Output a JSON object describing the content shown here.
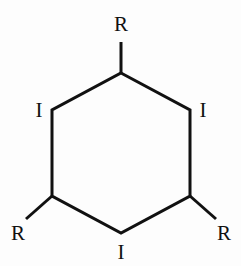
{
  "diagram": {
    "kind": "chemical-structure",
    "name": "substituted-cyclohexane-skeletal-formula",
    "background_color": "#fdfdfd",
    "bond_color": "#111111",
    "label_color": "#111111",
    "bond_width_px": 3,
    "ring": {
      "name": "six-membered-ring",
      "sides": 6,
      "orientation": "vertical-edges",
      "vertices": [
        {
          "id": "v-top",
          "x": 121,
          "y": 73
        },
        {
          "id": "v-upper-right",
          "x": 190,
          "y": 110
        },
        {
          "id": "v-lower-right",
          "x": 190,
          "y": 196
        },
        {
          "id": "v-bottom",
          "x": 121,
          "y": 233
        },
        {
          "id": "v-lower-left",
          "x": 52,
          "y": 196
        },
        {
          "id": "v-upper-left",
          "x": 52,
          "y": 110
        }
      ]
    },
    "substituent_bonds": [
      {
        "id": "bond-top-r",
        "from_x": 121,
        "from_y": 73,
        "to_x": 121,
        "to_y": 42
      },
      {
        "id": "bond-lower-left-r",
        "from_x": 52,
        "from_y": 196,
        "to_x": 26,
        "to_y": 219
      },
      {
        "id": "bond-lower-right-r",
        "from_x": 190,
        "from_y": 196,
        "to_x": 216,
        "to_y": 219
      }
    ],
    "labels": [
      {
        "id": "label-top-r",
        "text": "R",
        "x": 121,
        "y": 24,
        "position": "top"
      },
      {
        "id": "label-upper-left-i",
        "text": "I",
        "x": 39,
        "y": 110,
        "position": "upper-left"
      },
      {
        "id": "label-upper-right-i",
        "text": "I",
        "x": 203,
        "y": 110,
        "position": "upper-right"
      },
      {
        "id": "label-lower-left-r",
        "text": "R",
        "x": 18,
        "y": 233,
        "position": "lower-left"
      },
      {
        "id": "label-lower-right-r",
        "text": "R",
        "x": 224,
        "y": 233,
        "position": "lower-right"
      },
      {
        "id": "label-bottom-i",
        "text": "I",
        "x": 121,
        "y": 252,
        "position": "bottom"
      }
    ]
  }
}
